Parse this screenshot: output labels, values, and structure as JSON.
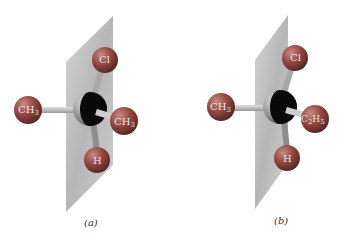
{
  "figure": {
    "panels": [
      {
        "id": "a",
        "caption": "(a)",
        "atoms": {
          "top": {
            "label": "Cl",
            "sub": ""
          },
          "left": {
            "label": "CH",
            "sub": "3"
          },
          "right": {
            "label": "CH",
            "sub": "3"
          },
          "bottom": {
            "label": "H",
            "sub": ""
          }
        }
      },
      {
        "id": "b",
        "caption": "(b)",
        "atoms": {
          "top": {
            "label": "Cl",
            "sub": ""
          },
          "left": {
            "label": "CH",
            "sub": "3"
          },
          "right": {
            "label": "C",
            "sub": "2",
            "label2": "H",
            "sub2": "5"
          },
          "bottom": {
            "label": "H",
            "sub": ""
          }
        }
      }
    ],
    "colors": {
      "plane": "#b8b8b8",
      "atom": "#9a4a45",
      "center_atom": "#8a8a8a",
      "shadow": "#000000",
      "bond": "#bdbdbd"
    }
  }
}
